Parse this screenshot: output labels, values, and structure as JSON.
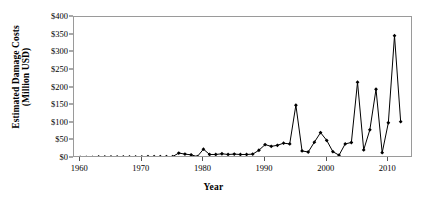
{
  "chart_data": {
    "type": "line",
    "title": "",
    "subtitle": "",
    "xlabel": "Year",
    "ylabel_line1": "Estimated Damage Costs",
    "ylabel_line2": "(Million USD)",
    "xlim": [
      1959,
      2014
    ],
    "ylim": [
      0,
      400
    ],
    "grid": false,
    "legend": "none",
    "marker": "filled-diamond",
    "line_color": "#000000",
    "marker_color": "#000000",
    "frame_color": "#9a9a9a",
    "xticks": [
      1960,
      1970,
      1980,
      1990,
      2000,
      2010
    ],
    "xticklabels": [
      "1960",
      "1970",
      "1980",
      "1990",
      "2000",
      "2010"
    ],
    "yticks": [
      0,
      50,
      100,
      150,
      200,
      250,
      300,
      350,
      400
    ],
    "yticklabels": [
      "$0",
      "$50",
      "$100",
      "$150",
      "$200",
      "$250",
      "$300",
      "$350",
      "$400"
    ],
    "x": [
      1960,
      1961,
      1962,
      1963,
      1964,
      1965,
      1966,
      1967,
      1968,
      1969,
      1970,
      1971,
      1972,
      1973,
      1974,
      1975,
      1976,
      1977,
      1978,
      1979,
      1980,
      1981,
      1982,
      1983,
      1984,
      1985,
      1986,
      1987,
      1988,
      1989,
      1990,
      1991,
      1992,
      1993,
      1994,
      1995,
      1996,
      1997,
      1998,
      1999,
      2000,
      2001,
      2002,
      2003,
      2004,
      2005,
      2006,
      2007,
      2008,
      2009,
      2010,
      2011,
      2012
    ],
    "values": [
      2,
      2,
      2,
      3,
      3,
      3,
      3,
      3,
      3,
      3,
      3,
      4,
      4,
      4,
      4,
      4,
      14,
      11,
      9,
      4,
      25,
      10,
      10,
      12,
      10,
      11,
      10,
      10,
      11,
      22,
      38,
      33,
      36,
      42,
      40,
      150,
      20,
      17,
      45,
      72,
      50,
      18,
      8,
      40,
      44,
      215,
      23,
      80,
      195,
      15,
      100,
      347,
      103
    ],
    "series": [
      {
        "name": "Estimated Damage Costs",
        "values": [
          2,
          2,
          2,
          3,
          3,
          3,
          3,
          3,
          3,
          3,
          3,
          4,
          4,
          4,
          4,
          4,
          14,
          11,
          9,
          4,
          25,
          10,
          10,
          12,
          10,
          11,
          10,
          10,
          11,
          22,
          38,
          33,
          36,
          42,
          40,
          150,
          20,
          17,
          45,
          72,
          50,
          18,
          8,
          40,
          44,
          215,
          23,
          80,
          195,
          15,
          100,
          347,
          103
        ]
      }
    ],
    "notable_points": [
      {
        "year": 1995,
        "value": 150
      },
      {
        "year": 2005,
        "value": 215
      },
      {
        "year": 2008,
        "value": 195
      },
      {
        "year": 2011,
        "value": 347
      }
    ]
  }
}
